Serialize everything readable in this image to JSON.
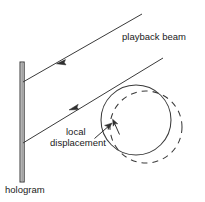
{
  "figure": {
    "background_color": "#ffffff",
    "stroke_color": "#3a3a3a",
    "text_color": "#1a1a1a",
    "width": 205,
    "height": 202
  },
  "labels": {
    "playback_beam": "playback beam",
    "hologram": "hologram",
    "local": "local",
    "displacement": "displacement"
  },
  "elements": {
    "hologram_plate": {
      "name": "hologram-plate",
      "x": 20,
      "y": 62,
      "width": 4,
      "height": 120
    },
    "beam_upper": {
      "name": "upper-playback-beam-ray",
      "x1": 22,
      "y1": 82,
      "x2": 142,
      "y2": 14,
      "arrow_at": [
        59,
        62
      ],
      "arrow_direction": "down-left"
    },
    "beam_lower": {
      "name": "lower-playback-beam-ray",
      "x1": 22,
      "y1": 143,
      "x2": 162,
      "y2": 58,
      "arrow_at": [
        72,
        108
      ],
      "arrow_direction": "down-left"
    },
    "object_circle_solid": {
      "name": "object-outline-solid",
      "cx": 136,
      "cy": 120,
      "r": 35,
      "style": "solid"
    },
    "object_circle_dashed": {
      "name": "object-outline-displaced-dashed",
      "cx": 146,
      "cy": 127,
      "r": 36,
      "style": "dashed",
      "dash_pattern": "6 5"
    },
    "displacement_pointer": {
      "name": "local-displacement-pointer-arrow",
      "x1": 95,
      "y1": 138,
      "x2": 111,
      "y2": 124
    },
    "displacement_gap_marker": {
      "name": "displacement-gap-marker",
      "x1": 113,
      "y1": 122,
      "x2": 119,
      "y2": 134
    }
  }
}
